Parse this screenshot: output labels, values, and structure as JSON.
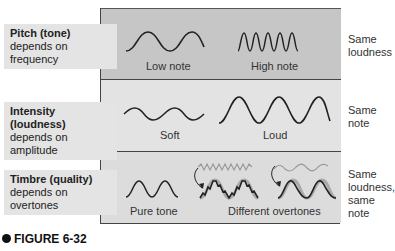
{
  "figure": {
    "label": "FIGURE 6-32"
  },
  "rows": [
    {
      "title": "Pitch (tone)",
      "description_lines": [
        "depends on",
        "frequency"
      ],
      "examples": [
        "Low note",
        "High note"
      ],
      "constant": [
        "Same",
        "loudness"
      ]
    },
    {
      "title": "Intensity (loudness)",
      "description_lines": [
        "depends on amplitude"
      ],
      "examples": [
        "Soft",
        "Loud"
      ],
      "constant": [
        "Same",
        "note"
      ]
    },
    {
      "title": "Timbre (quality)",
      "description_lines": [
        "depends on",
        "overtones"
      ],
      "examples": [
        "Pure tone",
        "Different overtones"
      ],
      "constant": [
        "Same",
        "loudness,",
        "same",
        "note"
      ]
    }
  ],
  "colors": {
    "band_pitch": "#c6c6c6",
    "band_intensity": "#e3e3e3",
    "band_timbre": "#dcdcdc",
    "label_bg": "#e4e4e4",
    "wave": "#222222",
    "overtone_wave": "#999999"
  }
}
